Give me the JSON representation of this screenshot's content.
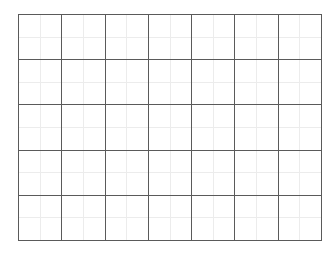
{
  "grid": {
    "columns": 7,
    "rows": 5,
    "origin": [
      18,
      14
    ],
    "size": [
      303,
      226
    ],
    "major_color": "#5a5a5a",
    "minor_color": "#ececec",
    "background": "#ffffff",
    "minor_subdivisions": 2
  }
}
